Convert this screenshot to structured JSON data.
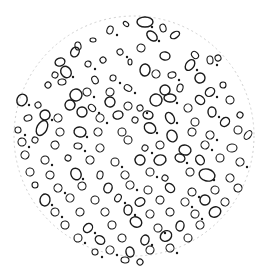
{
  "image": {
    "description": "Microscope field of view: circular field with scattered outlined particles/droplets",
    "background": "#ffffff",
    "ink": "#1a1a1a",
    "field": {
      "cx": 134,
      "cy": 136,
      "r": 120,
      "edge_color": "#cfcfcf"
    },
    "particles": [
      [
        145,
        22,
        8,
        5
      ],
      [
        126,
        24,
        3,
        2
      ],
      [
        163,
        28,
        4,
        3
      ],
      [
        110,
        30,
        4,
        3
      ],
      [
        175,
        35,
        5,
        3
      ],
      [
        93,
        40,
        3,
        2
      ],
      [
        152,
        36,
        6,
        4
      ],
      [
        78,
        46,
        4,
        3
      ],
      [
        141,
        48,
        4,
        4
      ],
      [
        120,
        52,
        3,
        3
      ],
      [
        165,
        56,
        5,
        4
      ],
      [
        195,
        55,
        4,
        3
      ],
      [
        210,
        60,
        4,
        3
      ],
      [
        75,
        52,
        5,
        4
      ],
      [
        60,
        62,
        5,
        4
      ],
      [
        88,
        64,
        3,
        3
      ],
      [
        103,
        60,
        3,
        3
      ],
      [
        130,
        62,
        3,
        2
      ],
      [
        190,
        65,
        6,
        4
      ],
      [
        218,
        58,
        3,
        3
      ],
      [
        55,
        75,
        3,
        3
      ],
      [
        66,
        72,
        6,
        5
      ],
      [
        145,
        70,
        6,
        5
      ],
      [
        156,
        74,
        4,
        4
      ],
      [
        172,
        75,
        4,
        3
      ],
      [
        200,
        78,
        5,
        5
      ],
      [
        95,
        80,
        4,
        3
      ],
      [
        113,
        78,
        3,
        3
      ],
      [
        48,
        85,
        3,
        3
      ],
      [
        62,
        82,
        4,
        3
      ],
      [
        128,
        88,
        4,
        3
      ],
      [
        165,
        90,
        5,
        5
      ],
      [
        180,
        88,
        4,
        3
      ],
      [
        210,
        92,
        5,
        4
      ],
      [
        223,
        85,
        3,
        3
      ],
      [
        76,
        95,
        6,
        6
      ],
      [
        87,
        92,
        4,
        4
      ],
      [
        110,
        92,
        4,
        4
      ],
      [
        156,
        100,
        6,
        6
      ],
      [
        170,
        98,
        6,
        4
      ],
      [
        200,
        100,
        5,
        4
      ],
      [
        230,
        100,
        4,
        4
      ],
      [
        22,
        100,
        6,
        5
      ],
      [
        38,
        105,
        3,
        3
      ],
      [
        70,
        105,
        5,
        5
      ],
      [
        92,
        108,
        4,
        3
      ],
      [
        110,
        102,
        5,
        5
      ],
      [
        128,
        106,
        4,
        4
      ],
      [
        140,
        108,
        3,
        3
      ],
      [
        148,
        115,
        5,
        4
      ],
      [
        188,
        108,
        4,
        4
      ],
      [
        212,
        112,
        5,
        4
      ],
      [
        240,
        115,
        3,
        3
      ],
      [
        28,
        118,
        4,
        3
      ],
      [
        45,
        115,
        5,
        5
      ],
      [
        58,
        118,
        4,
        4
      ],
      [
        82,
        112,
        5,
        5
      ],
      [
        100,
        118,
        4,
        4
      ],
      [
        118,
        115,
        5,
        4
      ],
      [
        135,
        120,
        3,
        3
      ],
      [
        170,
        118,
        6,
        4
      ],
      [
        195,
        122,
        4,
        4
      ],
      [
        225,
        122,
        5,
        4
      ],
      [
        18,
        130,
        3,
        3
      ],
      [
        42,
        128,
        5,
        8
      ],
      [
        60,
        132,
        4,
        4
      ],
      [
        80,
        132,
        5,
        6
      ],
      [
        98,
        132,
        4,
        4
      ],
      [
        122,
        132,
        4,
        4
      ],
      [
        150,
        128,
        6,
        5
      ],
      [
        172,
        136,
        6,
        5
      ],
      [
        192,
        132,
        4,
        4
      ],
      [
        210,
        135,
        4,
        4
      ],
      [
        238,
        130,
        4,
        4
      ],
      [
        248,
        135,
        3,
        5
      ],
      [
        22,
        142,
        4,
        4
      ],
      [
        35,
        140,
        3,
        3
      ],
      [
        55,
        145,
        4,
        4
      ],
      [
        78,
        146,
        4,
        3
      ],
      [
        100,
        148,
        4,
        4
      ],
      [
        128,
        140,
        4,
        4
      ],
      [
        145,
        148,
        3,
        3
      ],
      [
        160,
        145,
        4,
        4
      ],
      [
        185,
        150,
        6,
        5
      ],
      [
        205,
        145,
        4,
        4
      ],
      [
        232,
        148,
        4,
        5
      ],
      [
        25,
        155,
        4,
        4
      ],
      [
        45,
        160,
        4,
        4
      ],
      [
        68,
        158,
        3,
        3
      ],
      [
        90,
        160,
        4,
        4
      ],
      [
        115,
        162,
        4,
        4
      ],
      [
        140,
        160,
        5,
        5
      ],
      [
        160,
        160,
        6,
        5
      ],
      [
        180,
        158,
        5,
        4
      ],
      [
        200,
        160,
        5,
        4
      ],
      [
        220,
        158,
        4,
        4
      ],
      [
        240,
        162,
        4,
        4
      ],
      [
        30,
        172,
        4,
        4
      ],
      [
        50,
        175,
        4,
        4
      ],
      [
        76,
        174,
        6,
        5
      ],
      [
        100,
        175,
        4,
        3
      ],
      [
        125,
        175,
        4,
        4
      ],
      [
        150,
        172,
        4,
        4
      ],
      [
        165,
        178,
        3,
        3
      ],
      [
        190,
        172,
        4,
        4
      ],
      [
        207,
        175,
        6,
        8
      ],
      [
        230,
        178,
        4,
        4
      ],
      [
        35,
        185,
        3,
        3
      ],
      [
        58,
        188,
        4,
        4
      ],
      [
        82,
        186,
        4,
        4
      ],
      [
        108,
        188,
        5,
        4
      ],
      [
        130,
        185,
        4,
        4
      ],
      [
        148,
        190,
        4,
        4
      ],
      [
        170,
        188,
        5,
        4
      ],
      [
        192,
        192,
        4,
        4
      ],
      [
        215,
        190,
        4,
        4
      ],
      [
        238,
        188,
        4,
        4
      ],
      [
        45,
        200,
        5,
        6
      ],
      [
        70,
        198,
        4,
        4
      ],
      [
        95,
        200,
        4,
        4
      ],
      [
        118,
        198,
        4,
        3
      ],
      [
        140,
        202,
        5,
        4
      ],
      [
        160,
        200,
        4,
        4
      ],
      [
        185,
        202,
        4,
        4
      ],
      [
        205,
        200,
        5,
        5
      ],
      [
        225,
        202,
        4,
        4
      ],
      [
        55,
        212,
        4,
        4
      ],
      [
        80,
        212,
        4,
        4
      ],
      [
        105,
        212,
        4,
        4
      ],
      [
        128,
        210,
        5,
        4
      ],
      [
        150,
        214,
        4,
        4
      ],
      [
        170,
        212,
        4,
        4
      ],
      [
        195,
        214,
        4,
        4
      ],
      [
        215,
        212,
        5,
        6
      ],
      [
        65,
        225,
        4,
        4
      ],
      [
        88,
        228,
        5,
        4
      ],
      [
        112,
        225,
        4,
        4
      ],
      [
        136,
        222,
        6,
        5
      ],
      [
        158,
        228,
        4,
        4
      ],
      [
        180,
        226,
        5,
        4
      ],
      [
        200,
        225,
        4,
        4
      ],
      [
        78,
        238,
        4,
        4
      ],
      [
        100,
        240,
        5,
        4
      ],
      [
        122,
        238,
        4,
        4
      ],
      [
        145,
        240,
        5,
        4
      ],
      [
        166,
        236,
        6,
        5
      ],
      [
        188,
        238,
        4,
        4
      ],
      [
        110,
        250,
        4,
        4
      ],
      [
        130,
        252,
        5,
        4
      ],
      [
        150,
        250,
        4,
        4
      ],
      [
        170,
        248,
        4,
        4
      ],
      [
        125,
        260,
        4,
        3
      ],
      [
        140,
        262,
        3,
        3
      ],
      [
        95,
        252,
        3,
        3
      ]
    ]
  }
}
